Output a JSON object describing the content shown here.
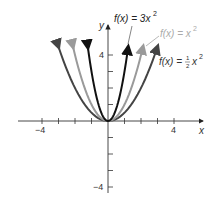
{
  "chart_data": {
    "type": "line",
    "title": "",
    "xlabel": "x",
    "ylabel": "y",
    "xlim": [
      -5,
      5
    ],
    "ylim": [
      -4.5,
      5
    ],
    "x_ticks": [
      -4,
      -3,
      -2,
      -1,
      1,
      2,
      3,
      4
    ],
    "x_tick_labels": [
      "-4",
      "4"
    ],
    "y_ticks": [
      -4,
      -3,
      -2,
      -1,
      1,
      2,
      3,
      4
    ],
    "y_tick_labels": [
      "-4",
      "4"
    ],
    "grid": false,
    "series": [
      {
        "name": "f(x) = 3x^2",
        "label": "f(x) = 3x²",
        "coef": 3,
        "color": "#111111",
        "x_range": [
          -1.22,
          1.22
        ]
      },
      {
        "name": "f(x) = x^2",
        "label": "f(x) = x²",
        "coef": 1,
        "color": "#9a9a9a",
        "x_range": [
          -2.12,
          2.12
        ]
      },
      {
        "name": "f(x) = 1/2 x^2",
        "label": "f(x) = ½x²",
        "coef": 0.5,
        "color": "#444444",
        "x_range": [
          -3,
          3
        ]
      }
    ]
  },
  "labels": {
    "y_axis": "y",
    "x_axis": "x",
    "x_neg4": "−4",
    "x_pos4": "4",
    "y_pos4": "4",
    "y_neg4": "−4",
    "f3_prefix": "f(x) = 3x",
    "f1_prefix": "f(x) = x",
    "fh_prefix": "f(x) = ",
    "fh_num": "1",
    "fh_den": "2",
    "fh_x": "x",
    "sup2": "2"
  }
}
